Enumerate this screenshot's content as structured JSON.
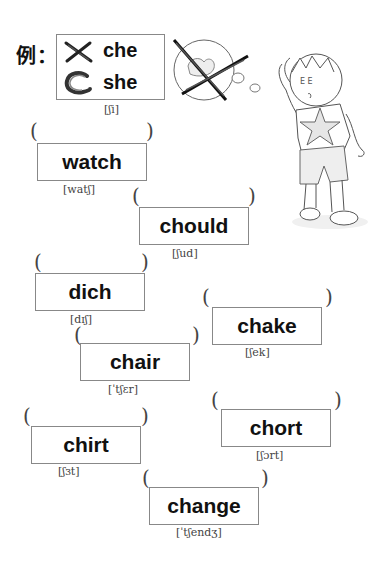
{
  "example": {
    "label": "例：",
    "options": [
      {
        "word": "che",
        "mark": "cross",
        "mark_icon": "cross-mark-icon"
      },
      {
        "word": "she",
        "mark": "circle",
        "mark_icon": "circle-mark-icon"
      }
    ],
    "phonetic": "[ʃi]"
  },
  "illustration": {
    "thought_bubble": "crossed-out-thought-bubble",
    "character": "thinking-boy"
  },
  "items": [
    {
      "word": "watch",
      "phonetic": "[watʃ]",
      "answer": ""
    },
    {
      "word": "chould",
      "phonetic": "[ʃud]",
      "answer": ""
    },
    {
      "word": "dich",
      "phonetic": "[dɪʃ]",
      "answer": ""
    },
    {
      "word": "chake",
      "phonetic": "[ʃek]",
      "answer": ""
    },
    {
      "word": "chair",
      "phonetic": "[ˈtʃɛr]",
      "answer": ""
    },
    {
      "word": "chirt",
      "phonetic": "[ʃɜt]",
      "answer": ""
    },
    {
      "word": "chort",
      "phonetic": "[ʃɔrt]",
      "answer": ""
    },
    {
      "word": "change",
      "phonetic": "[ˈtʃendʒ]",
      "answer": ""
    }
  ],
  "brackets": {
    "open": "(",
    "close": ")"
  }
}
